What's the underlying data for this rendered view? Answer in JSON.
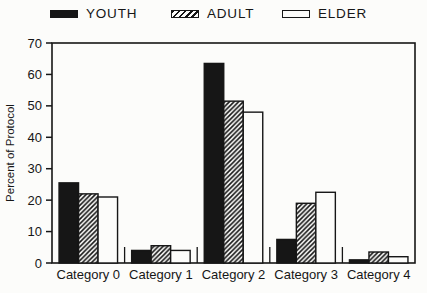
{
  "colors": {
    "ink": "#161616",
    "paper": "#fcfcfa"
  },
  "legend": {
    "items": [
      {
        "label": "YOUTH",
        "swatch": "solid-black"
      },
      {
        "label": "ADULT",
        "swatch": "diagonal-hatch"
      },
      {
        "label": "ELDER",
        "swatch": "white-outline"
      }
    ]
  },
  "chart_data": {
    "type": "bar",
    "title": "",
    "categories": [
      "Category 0",
      "Category 1",
      "Category 2",
      "Category 3",
      "Category 4"
    ],
    "series": [
      {
        "name": "YOUTH",
        "fill": "solid-black",
        "values": [
          25.5,
          4,
          63.5,
          7.5,
          1
        ]
      },
      {
        "name": "ADULT",
        "fill": "diagonal-hatch",
        "values": [
          22,
          5.5,
          51.5,
          19,
          3.5
        ]
      },
      {
        "name": "ELDER",
        "fill": "white-outline",
        "values": [
          21,
          4,
          48,
          22.5,
          2
        ]
      }
    ],
    "xlabel": "",
    "ylabel": "Percent of Protocol",
    "ylim": [
      0,
      70
    ],
    "yticks": [
      0,
      10,
      20,
      30,
      40,
      50,
      60,
      70
    ],
    "grid": false,
    "legend_position": "top",
    "bar_outline": true
  }
}
